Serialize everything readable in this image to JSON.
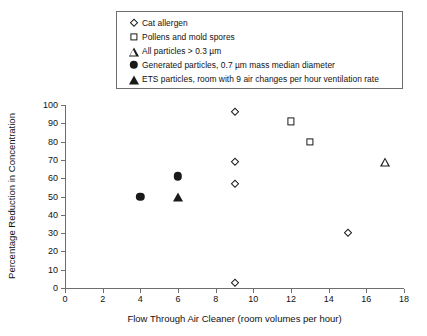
{
  "chart_data": {
    "type": "scatter",
    "title": "",
    "xlabel": "Flow Through Air Cleaner (room volumes per hour)",
    "ylabel": "Percentage Reduction in Concentration",
    "xlim": [
      0,
      18
    ],
    "ylim": [
      0,
      100
    ],
    "xticks": [
      0,
      2,
      4,
      6,
      8,
      10,
      12,
      14,
      16,
      18
    ],
    "yticks": [
      0,
      10,
      20,
      30,
      40,
      50,
      60,
      70,
      80,
      90,
      100
    ],
    "grid": false,
    "legend_position": "top-center",
    "series": [
      {
        "name": "Cat allergen",
        "marker": "open-diamond",
        "color": "#1a1a1a",
        "points": [
          {
            "x": 9,
            "y": 96
          },
          {
            "x": 9,
            "y": 69
          },
          {
            "x": 9,
            "y": 57
          },
          {
            "x": 9,
            "y": 3
          },
          {
            "x": 15,
            "y": 30
          }
        ]
      },
      {
        "name": "Pollens and mold spores",
        "marker": "open-square",
        "color": "#1a1a1a",
        "points": [
          {
            "x": 12,
            "y": 91
          },
          {
            "x": 13,
            "y": 80
          }
        ]
      },
      {
        "name": "All particles > 0.3 µm",
        "marker": "open-triangle",
        "color": "#1a1a1a",
        "points": [
          {
            "x": 17,
            "y": 69
          }
        ]
      },
      {
        "name": "Generated particles, 0.7 µm mass median diameter",
        "marker": "filled-circle",
        "color": "#1a1a1a",
        "points": [
          {
            "x": 4,
            "y": 50
          },
          {
            "x": 6,
            "y": 61
          }
        ]
      },
      {
        "name": "ETS particles, room with 9 air changes per hour ventilation rate",
        "marker": "filled-triangle",
        "color": "#1a1a1a",
        "points": [
          {
            "x": 6,
            "y": 50
          }
        ]
      }
    ]
  },
  "legend": {
    "items": [
      {
        "label": "Cat allergen",
        "marker": "open-diamond"
      },
      {
        "label": "Pollens and mold spores",
        "marker": "open-square"
      },
      {
        "label": "All particles > 0.3 µm",
        "marker": "open-triangle"
      },
      {
        "label": "Generated particles, 0.7 µm mass median diameter",
        "marker": "filled-circle"
      },
      {
        "label": "ETS particles, room with 9 air changes per hour ventilation rate",
        "marker": "filled-triangle"
      }
    ]
  },
  "colors": {
    "ink": "#1a1a1a",
    "axis": "#6e6e6e",
    "background": "#ffffff"
  }
}
